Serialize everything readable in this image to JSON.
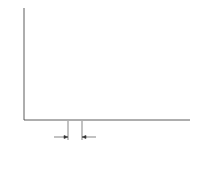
{
  "chart_data": {
    "type": "bar",
    "title": "",
    "xlabel": "Position, x",
    "ylabel": "Force, F(x)",
    "caption": "(b)",
    "annotations": [
      "x1",
      "x2",
      "Δx"
    ],
    "categories": [
      "1",
      "2",
      "3",
      "4",
      "5",
      "6",
      "7",
      "8",
      "9",
      "10",
      "11"
    ],
    "values": [
      22,
      34,
      52,
      67,
      81,
      90,
      91,
      86,
      80,
      75,
      73
    ],
    "ylim": [
      0,
      100
    ],
    "grid": false,
    "legend": "none",
    "curve": "smooth F(x) overlaid on rectangles (Riemann sum)"
  },
  "labels": {
    "ylabel_main": "Force, ",
    "ylabel_fn": "F(x)",
    "x1": "x",
    "x1_sub": "1",
    "x2": "x",
    "x2_sub": "2",
    "dx": "Δx",
    "xlabel_main": "Position, ",
    "xlabel_var": "x",
    "caption": "(b)"
  }
}
